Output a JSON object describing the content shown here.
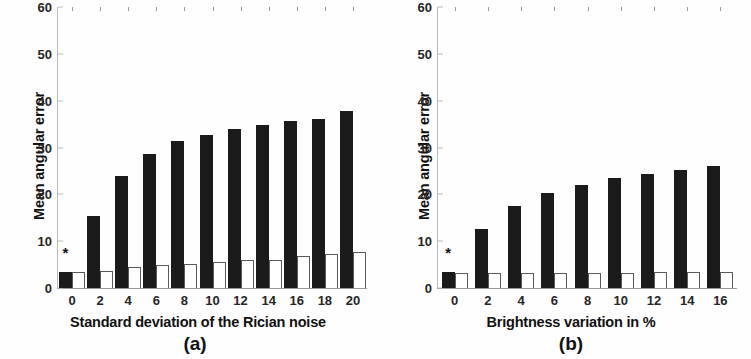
{
  "figure": {
    "background": "#ffffff",
    "bar_black_color": "#1b1b1b",
    "bar_white_color": "#ffffff",
    "bar_white_edge_color": "#5a5a5a",
    "axis_color": "#9a9a9a"
  },
  "chart_data": [
    {
      "type": "bar",
      "panel": "a",
      "caption": "(a)",
      "title": "",
      "xlabel": "Standard deviation of the Rician noise",
      "ylabel": "Mean angular error",
      "categories": [
        "0",
        "2",
        "4",
        "6",
        "8",
        "10",
        "12",
        "14",
        "16",
        "18",
        "20"
      ],
      "xticks": [
        "0",
        "2",
        "4",
        "6",
        "8",
        "10",
        "12",
        "14",
        "16",
        "18",
        "20"
      ],
      "yticks": [
        "0",
        "10",
        "20",
        "30",
        "40",
        "50",
        "60"
      ],
      "ytick_values": [
        0,
        10,
        20,
        30,
        40,
        50,
        60
      ],
      "ylim": [
        0,
        60
      ],
      "grid": false,
      "legend": null,
      "series": [
        {
          "name": "black-bars",
          "color": "#1b1b1b",
          "values": [
            3.5,
            15.3,
            23.9,
            28.7,
            31.4,
            32.7,
            34.0,
            34.8,
            35.6,
            36.0,
            37.8
          ]
        },
        {
          "name": "white-bars",
          "color": "#ffffff",
          "values": [
            3.4,
            3.7,
            4.4,
            4.9,
            5.2,
            5.6,
            6.0,
            6.0,
            6.9,
            7.2,
            7.6
          ]
        }
      ],
      "annotations": [
        {
          "marker": "*",
          "at_category": "0",
          "value": 6.0
        }
      ]
    },
    {
      "type": "bar",
      "panel": "b",
      "caption": "(b)",
      "title": "",
      "xlabel": "Brightness variation in %",
      "ylabel": "Mean angular error",
      "categories": [
        "0",
        "2",
        "4",
        "6",
        "8",
        "10",
        "12",
        "14",
        "16"
      ],
      "xticks": [
        "0",
        "2",
        "4",
        "6",
        "8",
        "10",
        "12",
        "14",
        "16"
      ],
      "yticks": [
        "0",
        "10",
        "20",
        "30",
        "40",
        "50",
        "60"
      ],
      "ytick_values": [
        0,
        10,
        20,
        30,
        40,
        50,
        60
      ],
      "ylim": [
        0,
        60
      ],
      "grid": false,
      "legend": null,
      "series": [
        {
          "name": "black-bars",
          "color": "#1b1b1b",
          "values": [
            3.4,
            12.6,
            17.5,
            20.2,
            22.0,
            23.4,
            24.4,
            25.3,
            26.0
          ]
        },
        {
          "name": "white-bars",
          "color": "#ffffff",
          "values": [
            3.3,
            3.3,
            3.3,
            3.3,
            3.3,
            3.3,
            3.4,
            3.4,
            3.4
          ]
        }
      ],
      "annotations": [
        {
          "marker": "*",
          "at_category": "0",
          "value": 6.0
        }
      ]
    }
  ]
}
